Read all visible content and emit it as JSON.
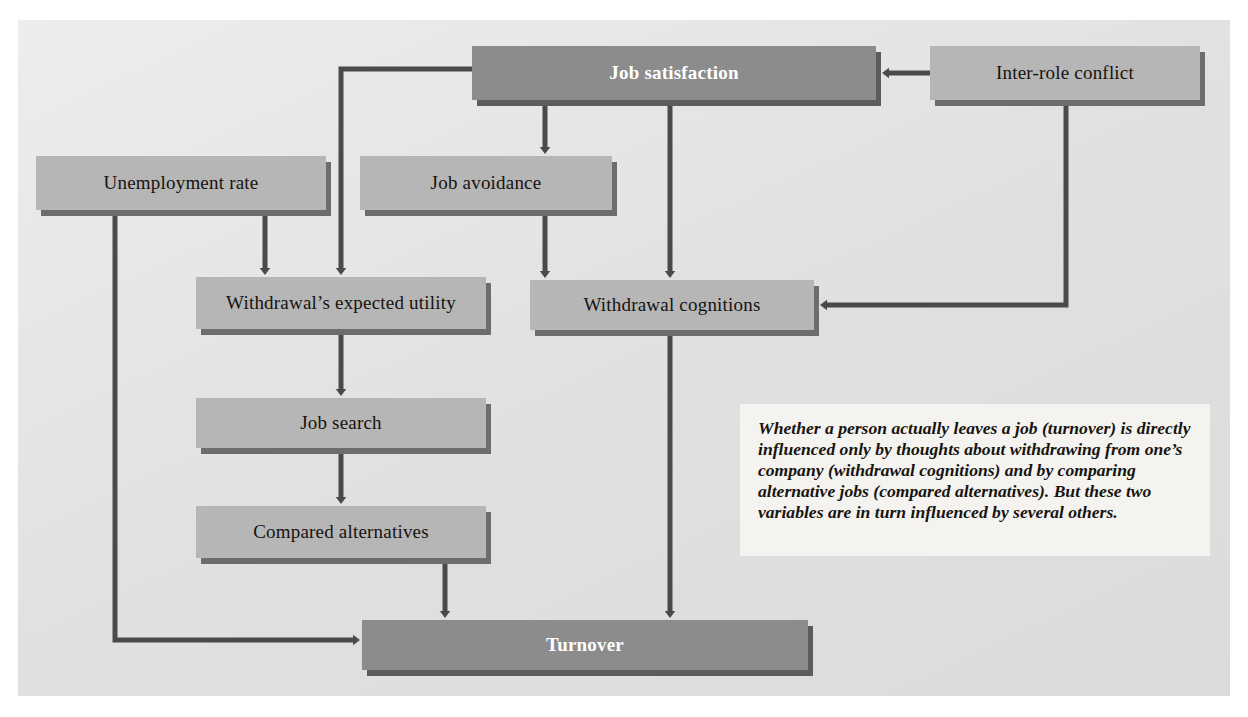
{
  "figure": {
    "panel_color": "#e7e7e7",
    "node_fill": "#b6b6b6",
    "node_fill_dark": "#8c8c8c",
    "node_shadow": "#6d6d6d",
    "connector_color": "#4a4a4a",
    "caption_bg": "#f4f3ef"
  },
  "nodes": [
    {
      "id": "job-satisfaction",
      "label": "Job satisfaction",
      "emphasis": "dark",
      "x": 472,
      "y": 46,
      "w": 404,
      "h": 54
    },
    {
      "id": "inter-role-conflict",
      "label": "Inter-role conflict",
      "emphasis": "light",
      "x": 930,
      "y": 46,
      "w": 270,
      "h": 54
    },
    {
      "id": "unemployment-rate",
      "label": "Unemployment rate",
      "emphasis": "light",
      "x": 36,
      "y": 156,
      "w": 290,
      "h": 54
    },
    {
      "id": "job-avoidance",
      "label": "Job avoidance",
      "emphasis": "light",
      "x": 360,
      "y": 156,
      "w": 252,
      "h": 54
    },
    {
      "id": "withdrawals-expected-utility",
      "label": "Withdrawal’s expected utility",
      "emphasis": "light",
      "x": 196,
      "y": 277,
      "w": 290,
      "h": 52
    },
    {
      "id": "withdrawal-cognitions",
      "label": "Withdrawal cognitions",
      "emphasis": "light",
      "x": 530,
      "y": 280,
      "w": 284,
      "h": 50
    },
    {
      "id": "job-search",
      "label": "Job search",
      "emphasis": "light",
      "x": 196,
      "y": 398,
      "w": 290,
      "h": 50
    },
    {
      "id": "compared-alternatives",
      "label": "Compared alternatives",
      "emphasis": "light",
      "x": 196,
      "y": 506,
      "w": 290,
      "h": 52
    },
    {
      "id": "turnover",
      "label": "Turnover",
      "emphasis": "dark",
      "x": 362,
      "y": 620,
      "w": 446,
      "h": 50
    }
  ],
  "caption": {
    "text": "Whether a person actually leaves a job (turnover) is directly influenced only by thoughts about withdrawing from one’s company (withdrawal cognitions) and by comparing alternative jobs (compared alternatives). But these two variables are in turn influenced by several others.",
    "x": 740,
    "y": 404,
    "w": 470,
    "h": 152
  },
  "connectors": [
    {
      "id": "inter-role-conflict-to-job-satisfaction",
      "from": "inter-role-conflict",
      "to": "job-satisfaction",
      "points": "930,73 886,73",
      "arrow": "left"
    },
    {
      "id": "inter-role-conflict-to-withdrawal-cognitions",
      "from": "inter-role-conflict",
      "to": "withdrawal-cognitions",
      "points": "1066,100 1066,305 824,305",
      "arrow": "left"
    },
    {
      "id": "job-satisfaction-to-job-avoidance",
      "from": "job-satisfaction",
      "to": "job-avoidance",
      "points": "545,100 545,150",
      "arrow": "down"
    },
    {
      "id": "job-avoidance-to-withdrawal-cognitions",
      "from": "job-avoidance",
      "to": "withdrawal-cognitions",
      "points": "545,210 545,274",
      "arrow": "down"
    },
    {
      "id": "job-satisfaction-to-withdrawal-cognitions",
      "from": "job-satisfaction",
      "to": "withdrawal-cognitions",
      "points": "670,100 670,274",
      "arrow": "down"
    },
    {
      "id": "job-satisfaction-to-withdrawals-expected-utility",
      "from": "job-satisfaction",
      "to": "withdrawals-expected-utility",
      "points": "472,69 341,69 341,271",
      "arrow": "down"
    },
    {
      "id": "unemployment-rate-to-withdrawals-expected-utility",
      "from": "unemployment-rate",
      "to": "withdrawals-expected-utility",
      "points": "265,210 265,271",
      "arrow": "down"
    },
    {
      "id": "unemployment-rate-to-turnover",
      "from": "unemployment-rate",
      "to": "turnover",
      "points": "115,210 115,640 356,640",
      "arrow": "right"
    },
    {
      "id": "withdrawals-expected-utility-to-job-search",
      "from": "withdrawals-expected-utility",
      "to": "job-search",
      "points": "341,329 341,392",
      "arrow": "down"
    },
    {
      "id": "job-search-to-compared-alternatives",
      "from": "job-search",
      "to": "compared-alternatives",
      "points": "341,448 341,500",
      "arrow": "down"
    },
    {
      "id": "compared-alternatives-to-turnover",
      "from": "compared-alternatives",
      "to": "turnover",
      "points": "445,558 445,614",
      "arrow": "down"
    },
    {
      "id": "withdrawal-cognitions-to-turnover",
      "from": "withdrawal-cognitions",
      "to": "turnover",
      "points": "670,330 670,614",
      "arrow": "down"
    }
  ]
}
